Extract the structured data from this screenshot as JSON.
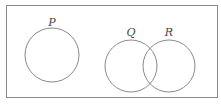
{
  "diagram": {
    "type": "venn",
    "universal_set": {
      "x": 6,
      "y": 5,
      "width": 211,
      "height": 92,
      "stroke": "#8a8a8a"
    },
    "sets": [
      {
        "label": "P",
        "cx": 52,
        "cy": 55,
        "r": 27,
        "label_x": 52,
        "label_y": 26
      },
      {
        "label": "Q",
        "cx": 131,
        "cy": 66,
        "r": 26,
        "label_x": 131,
        "label_y": 36
      },
      {
        "label": "R",
        "cx": 169,
        "cy": 66,
        "r": 26,
        "label_x": 169,
        "label_y": 36
      }
    ],
    "circle_stroke": "#8a8a8a",
    "relationships": {
      "P": "disjoint from Q and R",
      "Q_R": "overlapping"
    }
  }
}
